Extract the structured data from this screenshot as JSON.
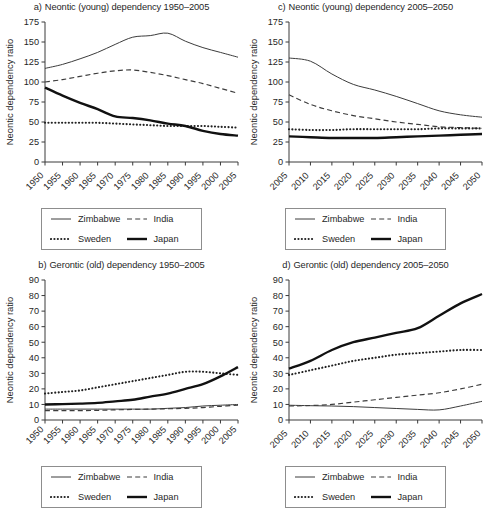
{
  "figure": {
    "panels": [
      "a",
      "b",
      "c",
      "d"
    ]
  },
  "panel_a": {
    "tag": "a)",
    "title": "Neontic (young) dependency 1950–2005",
    "ylabel": "Neontic dependency ratio"
  },
  "panel_b": {
    "tag": "b)",
    "title": "Gerontic (old) dependency 1950–2005",
    "ylabel": "Neontic dependency ratio"
  },
  "panel_c": {
    "tag": "c)",
    "title": "Neontic (young) dependency 2005–2050",
    "ylabel": "Neontic dependency ratio"
  },
  "panel_d": {
    "tag": "d)",
    "title": "Gerontic (old) dependency 2005–2050",
    "ylabel": "Neontic dependency ratio"
  },
  "legend": {
    "items": [
      {
        "label": "Zimbabwe",
        "style": "thin-solid",
        "key": "zimbabwe"
      },
      {
        "label": "India",
        "style": "dashed",
        "key": "india"
      },
      {
        "label": "Sweden",
        "style": "dotted",
        "key": "sweden"
      },
      {
        "label": "Japan",
        "style": "thick-solid",
        "key": "japan"
      }
    ]
  },
  "chart_data": [
    {
      "id": "a",
      "type": "line",
      "title": "a) Neontic (young) dependency 1950–2005",
      "xlabel": "",
      "ylabel": "Neontic dependency ratio",
      "x": [
        1950,
        1955,
        1960,
        1965,
        1970,
        1975,
        1980,
        1985,
        1990,
        1995,
        2000,
        2005
      ],
      "xticks": [
        "1950",
        "1955",
        "1960",
        "1965",
        "1970",
        "1975",
        "1980",
        "1985",
        "1990",
        "1995",
        "2000",
        "2005"
      ],
      "yticks": [
        0,
        25,
        50,
        75,
        100,
        125,
        150,
        175
      ],
      "ylim": [
        0,
        175
      ],
      "grid": false,
      "legend_position": "below",
      "series": [
        {
          "name": "Zimbabwe",
          "values": [
            117,
            122,
            129,
            137,
            147,
            156,
            158,
            161,
            151,
            143,
            137,
            131
          ]
        },
        {
          "name": "India",
          "values": [
            100,
            103,
            107,
            111,
            114,
            115,
            112,
            108,
            103,
            98,
            92,
            86
          ]
        },
        {
          "name": "Sweden",
          "values": [
            49,
            49,
            49,
            49,
            48,
            47,
            46,
            45,
            45,
            45,
            44,
            43
          ]
        },
        {
          "name": "Japan",
          "values": [
            93,
            83,
            74,
            66,
            57,
            55,
            52,
            48,
            45,
            39,
            35,
            33
          ]
        }
      ]
    },
    {
      "id": "b",
      "type": "line",
      "title": "b) Gerontic (old) dependency 1950–2005",
      "xlabel": "",
      "ylabel": "Neontic dependency ratio",
      "x": [
        1950,
        1955,
        1960,
        1965,
        1970,
        1975,
        1980,
        1985,
        1990,
        1995,
        2000,
        2005
      ],
      "xticks": [
        "1950",
        "1955",
        "1960",
        "1965",
        "1970",
        "1975",
        "1980",
        "1985",
        "1990",
        "1995",
        "2000",
        "2005"
      ],
      "yticks": [
        0,
        10,
        20,
        30,
        40,
        50,
        60,
        70,
        80,
        90
      ],
      "ylim": [
        0,
        90
      ],
      "grid": false,
      "legend_position": "below",
      "series": [
        {
          "name": "Zimbabwe",
          "values": [
            7,
            7,
            7,
            7,
            7,
            7,
            7,
            7.5,
            8,
            9,
            9.5,
            10
          ]
        },
        {
          "name": "India",
          "values": [
            6,
            6,
            6,
            6.2,
            6.5,
            6.8,
            7,
            7.2,
            7.5,
            8,
            8.8,
            9.5
          ]
        },
        {
          "name": "Sweden",
          "values": [
            17,
            18,
            19,
            21,
            23,
            25,
            27,
            29,
            31,
            31,
            30,
            29
          ]
        },
        {
          "name": "Japan",
          "values": [
            10,
            10.2,
            10.5,
            11,
            12,
            13,
            15,
            17,
            20,
            23,
            28,
            34
          ]
        }
      ]
    },
    {
      "id": "c",
      "type": "line",
      "title": "c) Neontic (young) dependency 2005–2050",
      "xlabel": "",
      "ylabel": "Neontic dependency ratio",
      "x": [
        2005,
        2010,
        2015,
        2020,
        2025,
        2030,
        2035,
        2040,
        2045,
        2050
      ],
      "xticks": [
        "2005",
        "2010",
        "2015",
        "2020",
        "2025",
        "2030",
        "2035",
        "2040",
        "2045",
        "2050"
      ],
      "yticks": [
        0,
        25,
        50,
        75,
        100,
        125,
        150,
        175
      ],
      "ylim": [
        0,
        175
      ],
      "grid": false,
      "legend_position": "below",
      "series": [
        {
          "name": "Zimbabwe",
          "values": [
            130,
            126,
            110,
            97,
            90,
            82,
            73,
            64,
            59,
            56
          ]
        },
        {
          "name": "India",
          "values": [
            84,
            72,
            64,
            58,
            54,
            50,
            47,
            44,
            43,
            42
          ]
        },
        {
          "name": "Sweden",
          "values": [
            41,
            40,
            40,
            41,
            41,
            41,
            41,
            42,
            42,
            42
          ]
        },
        {
          "name": "Japan",
          "values": [
            32,
            31,
            30,
            30,
            30,
            31,
            32,
            33,
            34,
            35
          ]
        }
      ]
    },
    {
      "id": "d",
      "type": "line",
      "title": "d) Gerontic (old) dependency 2005–2050",
      "xlabel": "",
      "ylabel": "Neontic dependency ratio",
      "x": [
        2005,
        2010,
        2015,
        2020,
        2025,
        2030,
        2035,
        2040,
        2045,
        2050
      ],
      "xticks": [
        "2005",
        "2010",
        "2015",
        "2020",
        "2025",
        "2030",
        "2035",
        "2040",
        "2045",
        "2050"
      ],
      "yticks": [
        0,
        10,
        20,
        30,
        40,
        50,
        60,
        70,
        80,
        90
      ],
      "ylim": [
        0,
        90
      ],
      "grid": false,
      "legend_position": "below",
      "series": [
        {
          "name": "Zimbabwe",
          "values": [
            9.5,
            9.2,
            9,
            8.6,
            8,
            7.4,
            6.8,
            6.5,
            9,
            12
          ]
        },
        {
          "name": "India",
          "values": [
            9,
            9.3,
            10,
            11.5,
            13,
            14.5,
            16,
            17.5,
            20,
            23
          ]
        },
        {
          "name": "Sweden",
          "values": [
            29,
            32,
            35,
            38,
            40,
            42,
            43,
            44,
            45,
            45
          ]
        },
        {
          "name": "Japan",
          "values": [
            33,
            38,
            45,
            50,
            53,
            56,
            59,
            67,
            75,
            81
          ]
        }
      ]
    }
  ]
}
